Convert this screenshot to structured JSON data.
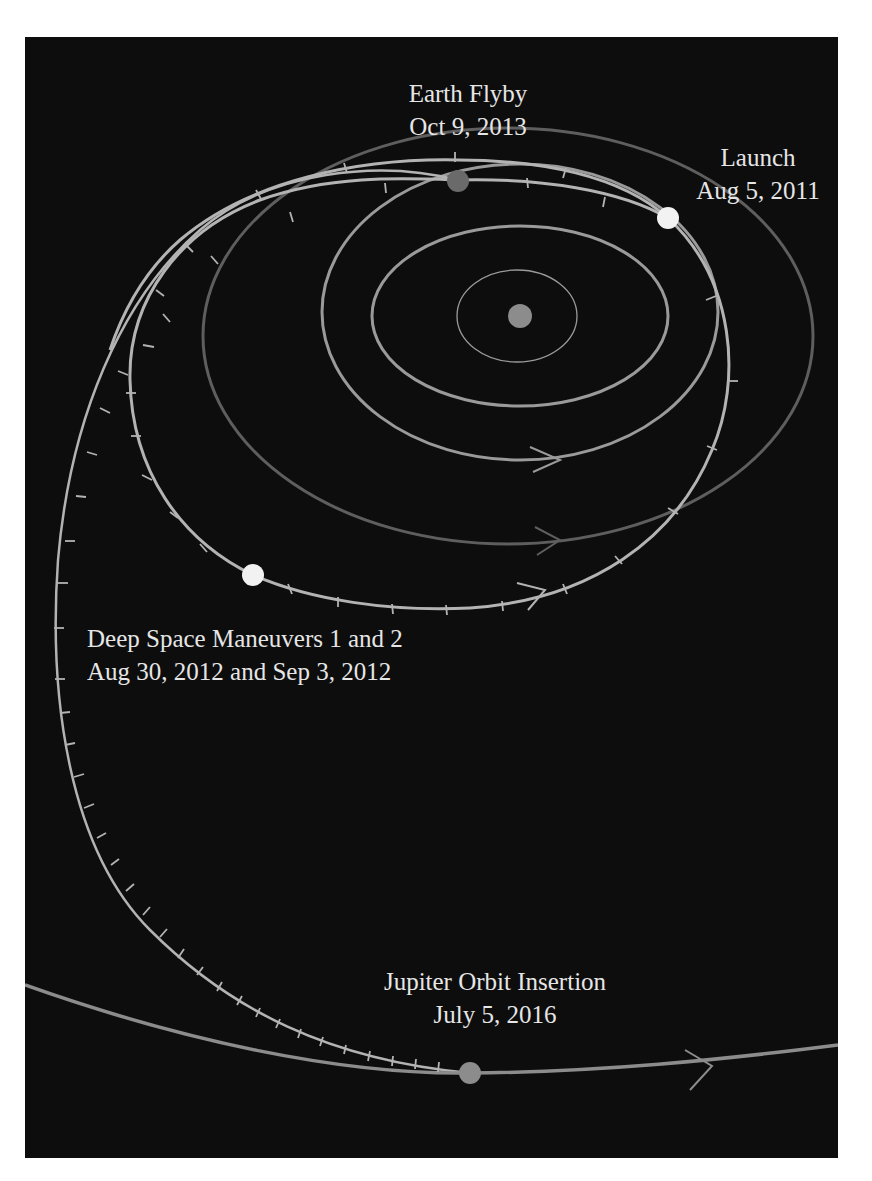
{
  "figure": {
    "background_color": "#0d0d0d",
    "orbit_color": "#9a9a9a",
    "faint_orbit_color": "#5e5e5e",
    "trajectory_color": "#b3b3b3"
  },
  "bodies": {
    "sun": {
      "name": "Sun",
      "color": "#8c8c8c"
    },
    "earth_marker": {
      "name": "Earth",
      "color": "#6a6a6a"
    },
    "jupiter_marker": {
      "name": "Jupiter",
      "color": "#8c8c8c"
    }
  },
  "events": [
    {
      "id": "launch",
      "title": "Launch",
      "date": "Aug 5, 2011",
      "marker_color": "#f2f2f2"
    },
    {
      "id": "earth_flyby",
      "title": "Earth Flyby",
      "date": "Oct 9, 2013",
      "marker_color": "#6a6a6a"
    },
    {
      "id": "dsm",
      "title": "Deep Space Maneuvers 1 and 2",
      "date": "Aug 30, 2012  and Sep 3, 2012",
      "marker_color": "#f2f2f2"
    },
    {
      "id": "joi",
      "title": "Jupiter Orbit Insertion",
      "date": "July 5, 2016",
      "marker_color": "#8c8c8c"
    }
  ],
  "orbits": [
    {
      "name": "Mercury orbit"
    },
    {
      "name": "Venus orbit"
    },
    {
      "name": "Earth orbit"
    },
    {
      "name": "Mars orbit"
    },
    {
      "name": "Jupiter orbit"
    }
  ]
}
